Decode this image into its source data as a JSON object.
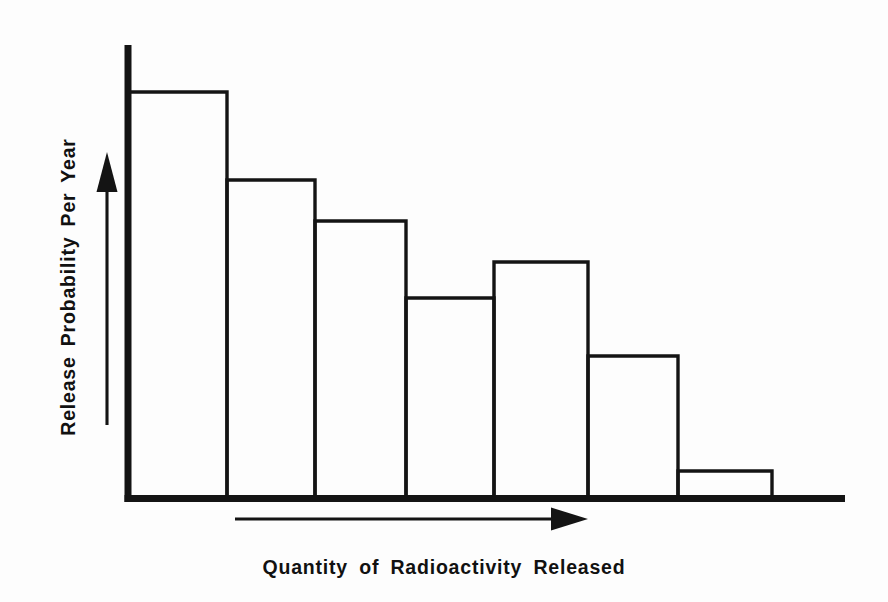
{
  "figure": {
    "background_color": "#fdfdfd",
    "ink_color": "#141414",
    "x_axis_title": "Quantity of Radioactivity Released",
    "y_axis_title": "Release Probability Per Year",
    "y_direction_arrow_label": "increasing-probability-arrow",
    "x_direction_arrow_label": "increasing-quantity-arrow"
  },
  "chart_data": {
    "type": "bar",
    "title": "",
    "subtitle": "",
    "xlabel": "Quantity of Radioactivity Released",
    "ylabel": "Release Probability Per Year",
    "categories": [
      "1",
      "2",
      "3",
      "4",
      "5",
      "6",
      "7"
    ],
    "values": [
      406,
      318,
      277,
      200,
      236,
      142,
      27
    ],
    "value_units": "relative pixel height above baseline",
    "xlim": [
      0,
      7
    ],
    "ylim": [
      0,
      453
    ],
    "grid": false,
    "legend": null,
    "axis_tick_labels": {
      "x": [],
      "y": []
    },
    "annotations": [
      "Upward arrow beside the y-axis indicating increasing release probability per year",
      "Rightward arrow below the x-axis indicating increasing quantity of radioactivity released"
    ],
    "bars": [
      {
        "index": 1,
        "x_left": 128,
        "x_right": 227,
        "top_y": 92,
        "height": 406
      },
      {
        "index": 2,
        "x_left": 227,
        "x_right": 315,
        "top_y": 180,
        "height": 318
      },
      {
        "index": 3,
        "x_left": 315,
        "x_right": 406,
        "top_y": 221,
        "height": 277
      },
      {
        "index": 4,
        "x_left": 406,
        "x_right": 494,
        "top_y": 298,
        "height": 200
      },
      {
        "index": 5,
        "x_left": 494,
        "x_right": 588,
        "top_y": 262,
        "height": 236
      },
      {
        "index": 6,
        "x_left": 588,
        "x_right": 678,
        "top_y": 356,
        "height": 142
      },
      {
        "index": 7,
        "x_left": 678,
        "x_right": 772,
        "top_y": 471,
        "height": 27
      }
    ],
    "baseline_y": 498,
    "y_axis_x": 128,
    "y_axis_top_y": 45,
    "x_axis_right_x": 845
  }
}
